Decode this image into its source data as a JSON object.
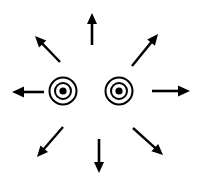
{
  "figure": {
    "width": 207,
    "height": 177,
    "background_color": "#ffffff",
    "stroke_color": "#000000"
  },
  "markers": [
    {
      "name": "left-concentric-circle",
      "label": "",
      "cx": 63,
      "cy": 91,
      "outer_radius": 13.5,
      "outer_stroke_width": 2.0,
      "inner_radius": 8.0,
      "inner_stroke_width": 2.0,
      "dot_radius": 3.6,
      "fill": "#000000"
    },
    {
      "name": "right-concentric-circle",
      "label": "",
      "cx": 119,
      "cy": 91,
      "outer_radius": 13.5,
      "outer_stroke_width": 2.0,
      "inner_radius": 8.0,
      "inner_stroke_width": 2.0,
      "dot_radius": 3.6,
      "fill": "#000000"
    }
  ],
  "arrows": [
    {
      "name": "arrow-north",
      "direction": "up",
      "compass": "N",
      "angle_deg": 90,
      "x1": 92,
      "y1": 45,
      "x2": 92,
      "y2": 13,
      "stroke_width": 2.6,
      "head_length": 11,
      "head_width": 10
    },
    {
      "name": "arrow-northeast",
      "direction": "up-right",
      "compass": "NE",
      "angle_deg": 45,
      "x1": 132,
      "y1": 66,
      "x2": 158,
      "y2": 34,
      "stroke_width": 2.4,
      "head_length": 11,
      "head_width": 10
    },
    {
      "name": "arrow-east",
      "direction": "right",
      "compass": "E",
      "angle_deg": 0,
      "x1": 152,
      "y1": 91,
      "x2": 190,
      "y2": 91,
      "stroke_width": 2.6,
      "head_length": 12,
      "head_width": 11
    },
    {
      "name": "arrow-southeast",
      "direction": "down-right",
      "compass": "SE",
      "angle_deg": -45,
      "x1": 133,
      "y1": 128,
      "x2": 163,
      "y2": 155,
      "stroke_width": 2.4,
      "head_length": 11,
      "head_width": 10
    },
    {
      "name": "arrow-south",
      "direction": "down",
      "compass": "S",
      "angle_deg": -90,
      "x1": 99,
      "y1": 139,
      "x2": 99,
      "y2": 173,
      "stroke_width": 2.6,
      "head_length": 11,
      "head_width": 10
    },
    {
      "name": "arrow-southwest",
      "direction": "down-left",
      "compass": "SW",
      "angle_deg": -135,
      "x1": 63,
      "y1": 127,
      "x2": 37,
      "y2": 157,
      "stroke_width": 2.4,
      "head_length": 11,
      "head_width": 10
    },
    {
      "name": "arrow-west",
      "direction": "left",
      "compass": "W",
      "angle_deg": 180,
      "x1": 44,
      "y1": 92,
      "x2": 12,
      "y2": 92,
      "stroke_width": 2.6,
      "head_length": 12,
      "head_width": 11
    },
    {
      "name": "arrow-northwest",
      "direction": "up-left",
      "compass": "NW",
      "angle_deg": 135,
      "x1": 60,
      "y1": 62,
      "x2": 35,
      "y2": 36,
      "stroke_width": 2.4,
      "head_length": 11,
      "head_width": 10
    }
  ]
}
